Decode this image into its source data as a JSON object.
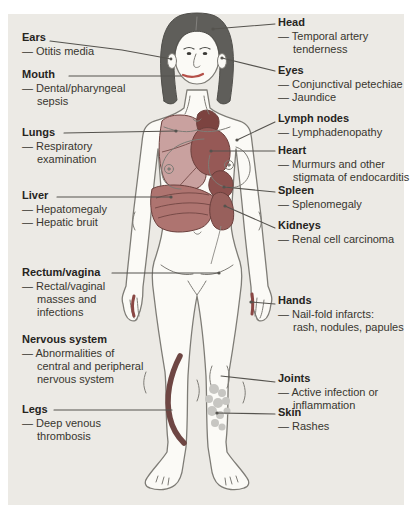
{
  "panel": {
    "background": "#ECEAE5"
  },
  "colors": {
    "outline": "#7E7C76",
    "hair": "#5F5E5A",
    "skin": "#FBFAF6",
    "lungs": "#C9A19F",
    "heart": "#965956",
    "vessels": "#7C4340",
    "liver": "#AE7470",
    "spleen": "#8C514E",
    "kidneys": "#98605C",
    "vein": "#6E4643",
    "rash": "#C7C6C2",
    "lips": "#B44F48",
    "infarct": "#8A4744",
    "leader": "#55534E"
  },
  "labels": {
    "left": [
      {
        "title": "Ears",
        "finding_lines": [
          "— Otitis media"
        ]
      },
      {
        "title": "Mouth",
        "finding_lines": [
          "— Dental/pharyngeal",
          "sepsis"
        ]
      },
      {
        "title": "Lungs",
        "finding_lines": [
          "— Respiratory",
          "examination"
        ]
      },
      {
        "title": "Liver",
        "finding_lines": [
          "— Hepatomegaly",
          "— Hepatic bruit"
        ]
      },
      {
        "title": "Rectum/vagina",
        "finding_lines": [
          "— Rectal/vaginal",
          "masses and",
          "infections"
        ]
      },
      {
        "title": "Nervous system",
        "finding_lines": [
          "— Abnormalities of",
          "central and peripheral",
          "nervous system"
        ]
      },
      {
        "title": "Legs",
        "finding_lines": [
          "— Deep venous",
          "thrombosis"
        ]
      }
    ],
    "right": [
      {
        "title": "Head",
        "finding_lines": [
          "— Temporal artery",
          "tenderness"
        ]
      },
      {
        "title": "Eyes",
        "finding_lines": [
          "— Conjunctival petechiae",
          "— Jaundice"
        ]
      },
      {
        "title": "Lymph nodes",
        "finding_lines": [
          "— Lymphadenopathy"
        ]
      },
      {
        "title": "Heart",
        "finding_lines": [
          "— Murmurs and other",
          "stigmata of endocarditis"
        ]
      },
      {
        "title": "Spleen",
        "finding_lines": [
          "— Splenomegaly"
        ]
      },
      {
        "title": "Kidneys",
        "finding_lines": [
          "— Renal cell carcinoma"
        ]
      },
      {
        "title": "Hands",
        "finding_lines": [
          "— Nail-fold infarcts:",
          "rash, nodules, papules"
        ]
      },
      {
        "title": "Joints",
        "finding_lines": [
          "— Active infection or",
          "inflammation"
        ]
      },
      {
        "title": "Skin",
        "finding_lines": [
          "— Rashes"
        ]
      }
    ]
  }
}
